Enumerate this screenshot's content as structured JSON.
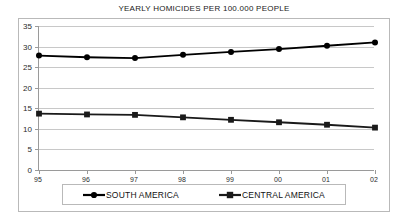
{
  "chart_data": {
    "type": "line",
    "title": "YEARLY HOMICIDES PER 100.000 PEOPLE",
    "xlabel": "",
    "ylabel": "",
    "categories": [
      "95",
      "96",
      "97",
      "98",
      "99",
      "00",
      "01",
      "02"
    ],
    "ylim": [
      0,
      35
    ],
    "yticks": [
      0,
      5,
      10,
      15,
      20,
      25,
      30,
      35
    ],
    "grid": "horizontal",
    "legend_position": "bottom",
    "series": [
      {
        "name": "SOUTH AMERICA",
        "marker": "circle",
        "color": "#000000",
        "values": [
          27.8,
          27.4,
          27.2,
          28.0,
          28.7,
          29.4,
          30.2,
          31.0
        ]
      },
      {
        "name": "CENTRAL AMERICA",
        "marker": "square",
        "color": "#1a1a1a",
        "values": [
          13.7,
          13.5,
          13.4,
          12.8,
          12.2,
          11.6,
          11.0,
          10.3
        ]
      }
    ]
  },
  "axis": {
    "y_tick_labels": [
      "35",
      "30",
      "25",
      "20",
      "15",
      "10",
      "5",
      "0"
    ],
    "x_tick_labels": [
      "95",
      "96",
      "97",
      "98",
      "99",
      "00",
      "01",
      "02"
    ]
  },
  "legend": {
    "entries": [
      {
        "label": "SOUTH AMERICA",
        "marker": "circle-marker"
      },
      {
        "label": "CENTRAL AMERICA",
        "marker": "square-marker"
      }
    ]
  },
  "colors": {
    "series_line": "#000000",
    "gridline": "#c8c8c8",
    "axis": "#9a9a9a",
    "frame_border": "#b9b9b9",
    "background": "#ffffff"
  }
}
